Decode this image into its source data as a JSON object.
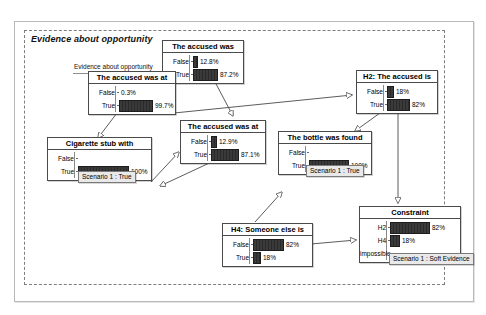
{
  "diagram": {
    "type": "bayesian-network",
    "container_title": "Evidence about opportunity",
    "floating_label": "Evidence about opportunity",
    "colors": {
      "bar_fill": "#333333",
      "node_border": "#4a4a4a",
      "badge_bg": "#e9e9e9",
      "group_border": "#7d7d7d",
      "frame_border": "#b9b9b9"
    }
  },
  "nodes": [
    {
      "id": "accused-was",
      "title": "The accused was",
      "x": 162,
      "y": 40,
      "w": 80,
      "rows": [
        {
          "label": "False",
          "value": "12.8%",
          "pct": 12.8
        },
        {
          "label": "True",
          "value": "87.2%",
          "pct": 87.2
        }
      ],
      "badge": null
    },
    {
      "id": "accused-was-at-left",
      "title": "The accused was at",
      "x": 88,
      "y": 71,
      "w": 86,
      "rows": [
        {
          "label": "False",
          "value": "0.3%",
          "pct": 0.3
        },
        {
          "label": "True",
          "value": "99.7%",
          "pct": 99.7
        }
      ],
      "badge": null
    },
    {
      "id": "h2-accused-is",
      "title": "H2: The accused is",
      "x": 356,
      "y": 70,
      "w": 80,
      "rows": [
        {
          "label": "False",
          "value": "18%",
          "pct": 18
        },
        {
          "label": "True",
          "value": "82%",
          "pct": 82
        }
      ],
      "badge": null
    },
    {
      "id": "accused-was-at-mid",
      "title": "The accused was at",
      "x": 180,
      "y": 120,
      "w": 84,
      "rows": [
        {
          "label": "False",
          "value": "12.9%",
          "pct": 12.9
        },
        {
          "label": "True",
          "value": "87.1%",
          "pct": 87.1
        }
      ],
      "badge": null
    },
    {
      "id": "cigarette-stub",
      "title": "Cigarette stub with",
      "x": 47,
      "y": 137,
      "w": 103,
      "rows": [
        {
          "label": "False",
          "value": "",
          "pct": 0
        },
        {
          "label": "True",
          "value": "100%",
          "pct": 100
        }
      ],
      "badge": "Scenario 1 : True"
    },
    {
      "id": "bottle-was-found",
      "title": "The bottle was found",
      "x": 278,
      "y": 131,
      "w": 92,
      "rows": [
        {
          "label": "False",
          "value": "",
          "pct": 0
        },
        {
          "label": "True",
          "value": "100%",
          "pct": 100
        }
      ],
      "badge": "Scenario 1 : True"
    },
    {
      "id": "h4-someone-else",
      "title": "H4: Someone else is",
      "x": 222,
      "y": 223,
      "w": 89,
      "rows": [
        {
          "label": "False",
          "value": "82%",
          "pct": 82
        },
        {
          "label": "True",
          "value": "18%",
          "pct": 18
        }
      ],
      "badge": null
    },
    {
      "id": "constraint",
      "title": "Constraint",
      "x": 359,
      "y": 206,
      "w": 100,
      "rows": [
        {
          "label": "H2",
          "value": "82%",
          "pct": 82
        },
        {
          "label": "H4",
          "value": "18%",
          "pct": 18
        },
        {
          "label": "impossible",
          "value": "",
          "pct": 0
        }
      ],
      "badge": "Scenario 1 : Soft Evidence"
    }
  ],
  "edges": [
    {
      "from": "accused-was-at-left",
      "to": "cigarette-stub"
    },
    {
      "from": "accused-was-at-left",
      "to": "h2-accused-is"
    },
    {
      "from": "accused-was",
      "to": "accused-was-at-mid"
    },
    {
      "from": "h2-accused-is",
      "to": "bottle-was-found"
    },
    {
      "from": "h2-accused-is",
      "to": "constraint"
    },
    {
      "from": "h4-someone-else",
      "to": "bottle-was-found"
    },
    {
      "from": "h4-someone-else",
      "to": "constraint"
    },
    {
      "from": "accused-was-at-mid",
      "to": "h4-someone-else"
    }
  ]
}
